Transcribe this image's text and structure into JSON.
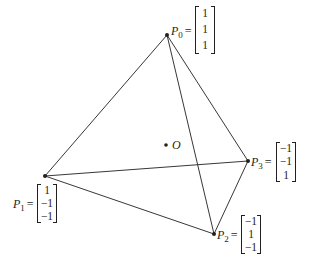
{
  "diagram": {
    "type": "tetrahedron",
    "center": {
      "label": "O",
      "x": 166,
      "y": 145
    },
    "vertices": [
      {
        "id": "P0",
        "name": "P",
        "sub": "0",
        "eq": "=",
        "coords": [
          "1",
          "1",
          "1"
        ],
        "x": 167,
        "y": 35
      },
      {
        "id": "P1",
        "name": "P",
        "sub": "1",
        "eq": "=",
        "coords": [
          "1",
          "−1",
          "−1"
        ],
        "x": 45,
        "y": 176
      },
      {
        "id": "P2",
        "name": "P",
        "sub": "2",
        "eq": "=",
        "coords": [
          "−1",
          "1",
          "−1"
        ],
        "x": 214,
        "y": 234
      },
      {
        "id": "P3",
        "name": "P",
        "sub": "3",
        "eq": "=",
        "coords": [
          "−1",
          "−1",
          "1"
        ],
        "x": 248,
        "y": 161
      }
    ],
    "edges": [
      [
        "P0",
        "P1"
      ],
      [
        "P0",
        "P2"
      ],
      [
        "P0",
        "P3"
      ],
      [
        "P1",
        "P3"
      ],
      [
        "P1",
        "P2"
      ],
      [
        "P2",
        "P3"
      ]
    ],
    "colors": {
      "line": "#231f20",
      "background": "#ffffff"
    }
  }
}
